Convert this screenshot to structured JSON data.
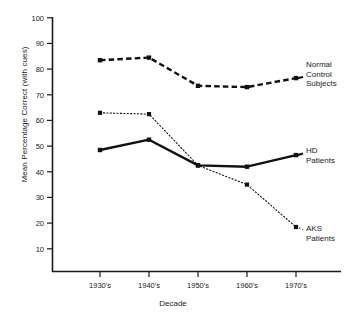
{
  "chart_data": {
    "type": "line",
    "title": "",
    "xlabel": "Decade",
    "ylabel": "Mean Percentage Correct (with cues)",
    "categories": [
      "1930's",
      "1940's",
      "1950's",
      "1960's",
      "1970's"
    ],
    "ylim": [
      0,
      100
    ],
    "yticks": [
      10,
      20,
      30,
      40,
      50,
      60,
      70,
      80,
      90,
      100
    ],
    "grid": false,
    "legend_position": "right-inline",
    "series": [
      {
        "name": "Normal Control Subjects",
        "label_lines": [
          "Normal",
          "Control",
          "Subjects"
        ],
        "style": "dashed",
        "color": "#111111",
        "values": [
          83.5,
          84.5,
          73.5,
          73.0,
          76.5
        ]
      },
      {
        "name": "HD Patients",
        "label_lines": [
          "HD",
          "Patients"
        ],
        "style": "solid",
        "color": "#111111",
        "values": [
          48.5,
          52.5,
          42.5,
          42.0,
          46.5
        ]
      },
      {
        "name": "AKS Patients",
        "label_lines": [
          "AKS",
          "Patients"
        ],
        "style": "dotted",
        "color": "#111111",
        "values": [
          63.0,
          62.5,
          42.5,
          35.0,
          18.5
        ]
      }
    ]
  },
  "axis": {
    "y": {
      "ticks": [
        {
          "label": "100"
        },
        {
          "label": "90"
        },
        {
          "label": "80"
        },
        {
          "label": "70"
        },
        {
          "label": "60"
        },
        {
          "label": "50"
        },
        {
          "label": "40"
        },
        {
          "label": "30"
        },
        {
          "label": "20"
        },
        {
          "label": "10"
        }
      ],
      "title": "Mean Percentage Correct (with cues)"
    },
    "x": {
      "ticks": [
        {
          "label": "1930's"
        },
        {
          "label": "1940's"
        },
        {
          "label": "1950's"
        },
        {
          "label": "1960's"
        },
        {
          "label": "1970's"
        }
      ],
      "title": "Decade"
    }
  },
  "legend": {
    "normal_control": {
      "line1": "Normal",
      "line2": "Control",
      "line3": "Subjects"
    },
    "hd": {
      "line1": "HD",
      "line2": "Patients"
    },
    "aks": {
      "line1": "AKS",
      "line2": "Patients"
    }
  }
}
